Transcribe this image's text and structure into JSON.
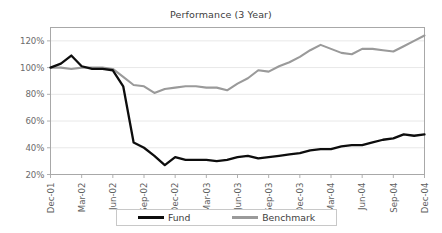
{
  "chart_data": {
    "type": "line",
    "title": "Performance (3 Year)",
    "xlabel": "",
    "ylabel": "",
    "ylim": [
      20,
      130
    ],
    "ytick_values": [
      20,
      40,
      60,
      80,
      100,
      120
    ],
    "ytick_labels": [
      "20%",
      "40%",
      "60%",
      "80%",
      "100%",
      "120%"
    ],
    "grid": true,
    "legend_position": "bottom",
    "x": [
      "Dec-01",
      "Jan-02",
      "Feb-02",
      "Mar-02",
      "Apr-02",
      "May-02",
      "Jun-02",
      "Jul-02",
      "Aug-02",
      "Sep-02",
      "Oct-02",
      "Nov-02",
      "Dec-02",
      "Jan-03",
      "Feb-03",
      "Mar-03",
      "Apr-03",
      "May-03",
      "Jun-03",
      "Jul-03",
      "Aug-03",
      "Sep-03",
      "Oct-03",
      "Nov-03",
      "Dec-03",
      "Jan-04",
      "Feb-04",
      "Mar-04",
      "Apr-04",
      "May-04",
      "Jun-04",
      "Jul-04",
      "Aug-04",
      "Sep-04",
      "Oct-04",
      "Nov-04",
      "Dec-04"
    ],
    "xtick_labels": [
      "Dec-01",
      "Mar-02",
      "Jun-02",
      "Sep-02",
      "Dec-02",
      "Mar-03",
      "Jun-03",
      "Sep-03",
      "Dec-03",
      "Mar-04",
      "Jun-04",
      "Sep-04",
      "Dec-04"
    ],
    "xtick_indices": [
      0,
      3,
      6,
      9,
      12,
      15,
      18,
      21,
      24,
      27,
      30,
      33,
      36
    ],
    "series": [
      {
        "name": "Fund",
        "color": "#0d0d0d",
        "values": [
          100,
          103,
          109,
          101,
          99,
          99,
          98,
          86,
          44,
          40,
          34,
          27,
          33,
          31,
          31,
          31,
          30,
          31,
          33,
          34,
          32,
          33,
          34,
          35,
          36,
          38,
          39,
          39,
          41,
          42,
          42,
          44,
          46,
          47,
          50,
          49,
          50
        ]
      },
      {
        "name": "Benchmark",
        "color": "#9a9a9a",
        "values": [
          100,
          100,
          99,
          100,
          100,
          100,
          99,
          93,
          87,
          86,
          81,
          84,
          85,
          86,
          86,
          85,
          85,
          83,
          88,
          92,
          98,
          97,
          101,
          104,
          108,
          113,
          117,
          114,
          111,
          110,
          114,
          114,
          113,
          112,
          116,
          120,
          124
        ]
      }
    ]
  },
  "legend": {
    "items": [
      {
        "label": "Fund",
        "color": "#0d0d0d"
      },
      {
        "label": "Benchmark",
        "color": "#9a9a9a"
      }
    ]
  }
}
